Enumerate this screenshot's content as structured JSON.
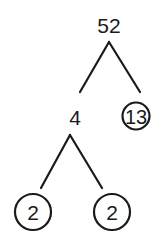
{
  "diagram": {
    "type": "factor-tree",
    "root": {
      "value": "52",
      "children": [
        {
          "value": "4",
          "prime": false,
          "children": [
            {
              "value": "2",
              "prime": true
            },
            {
              "value": "2",
              "prime": true
            }
          ]
        },
        {
          "value": "13",
          "prime": true
        }
      ]
    },
    "nodes": {
      "root": "52",
      "composite_factor": "4",
      "prime_13": "13",
      "prime_2_left": "2",
      "prime_2_right": "2"
    },
    "color": "#1a1a1a"
  }
}
